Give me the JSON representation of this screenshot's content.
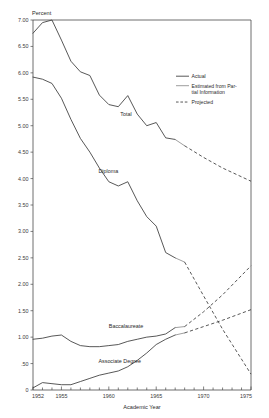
{
  "chart_data": {
    "type": "line",
    "title": "",
    "xlabel": "Academic Year",
    "ylabel": "Percent",
    "xlim": [
      1952,
      1975
    ],
    "ylim": [
      0,
      7.0
    ],
    "grid": false,
    "legend_position": "upper-right",
    "ytick_labels": [
      "7.00",
      "6.50",
      "6.00",
      "5.50",
      "5.00",
      "4.50",
      "4.00",
      "3.50",
      "3.00",
      "2.50",
      "2.00",
      "1.50",
      "1.00",
      ".50",
      "0"
    ],
    "ytick_values": [
      7.0,
      6.5,
      6.0,
      5.5,
      5.0,
      4.5,
      4.0,
      3.5,
      3.0,
      2.5,
      2.0,
      1.5,
      1.0,
      0.5,
      0.0
    ],
    "xtick_labels": [
      "1952",
      "1955",
      "1960",
      "1965",
      "1970",
      "1975"
    ],
    "xtick_values": [
      1952,
      1955,
      1960,
      1965,
      1970,
      1975
    ],
    "xtick_minor": [
      1953,
      1954,
      1956,
      1957,
      1958,
      1959,
      1961,
      1962,
      1963,
      1964,
      1966,
      1967,
      1968,
      1969,
      1971,
      1972,
      1973,
      1974
    ],
    "legend": [
      {
        "label": "Actual",
        "style": "solid",
        "color": "#3a3a3a"
      },
      {
        "label": "Estimated from Par-",
        "label2": "tial Information",
        "style": "solid-light",
        "color": "#8c8c8c"
      },
      {
        "label": "Projected",
        "style": "dashed",
        "color": "#3a3a3a"
      }
    ],
    "series": [
      {
        "name": "Total",
        "label_text": "Total",
        "actual": {
          "x": [
            1952,
            1953,
            1954,
            1955,
            1956,
            1957,
            1958,
            1959,
            1960,
            1961,
            1962,
            1963,
            1964,
            1965,
            1966,
            1967
          ],
          "y": [
            6.75,
            6.95,
            7.0,
            6.62,
            6.22,
            6.02,
            5.95,
            5.58,
            5.4,
            5.36,
            5.57,
            5.22,
            5.0,
            5.06,
            4.77,
            4.74
          ]
        },
        "estimated": {
          "x": [
            1967,
            1968
          ],
          "y": [
            4.74,
            4.62
          ]
        },
        "projected": {
          "x": [
            1968,
            1970,
            1972,
            1975
          ],
          "y": [
            4.62,
            4.4,
            4.2,
            3.95
          ]
        }
      },
      {
        "name": "Diploma",
        "label_text": "Diploma",
        "actual": {
          "x": [
            1952,
            1953,
            1954,
            1955,
            1956,
            1957,
            1958,
            1959,
            1960,
            1961,
            1962,
            1963,
            1964,
            1965,
            1966,
            1967
          ],
          "y": [
            5.92,
            5.88,
            5.8,
            5.52,
            5.12,
            4.76,
            4.5,
            4.2,
            3.94,
            3.86,
            3.94,
            3.58,
            3.28,
            3.1,
            2.6,
            2.5
          ]
        },
        "estimated": {
          "x": [
            1967,
            1968
          ],
          "y": [
            2.5,
            2.42
          ]
        },
        "projected": {
          "x": [
            1968,
            1970,
            1972,
            1975
          ],
          "y": [
            2.42,
            1.78,
            1.15,
            0.3
          ]
        }
      },
      {
        "name": "Baccalaureate",
        "label_text": "Baccalaureate",
        "actual": {
          "x": [
            1952,
            1953,
            1954,
            1955,
            1956,
            1957,
            1958,
            1959,
            1960,
            1961,
            1962,
            1963,
            1964,
            1965,
            1966,
            1967
          ],
          "y": [
            0.96,
            0.98,
            1.02,
            1.04,
            0.92,
            0.84,
            0.82,
            0.82,
            0.84,
            0.86,
            0.92,
            0.96,
            1.0,
            1.02,
            1.06,
            1.18
          ]
        },
        "estimated": {
          "x": [
            1967,
            1968
          ],
          "y": [
            1.18,
            1.2
          ]
        },
        "projected": {
          "x": [
            1968,
            1970,
            1972,
            1975
          ],
          "y": [
            1.2,
            1.48,
            1.8,
            2.35
          ]
        }
      },
      {
        "name": "Associate Degree",
        "label_text": "Associate Degree",
        "actual": {
          "x": [
            1952,
            1953,
            1954,
            1955,
            1956,
            1957,
            1958,
            1959,
            1960,
            1961,
            1962,
            1963,
            1964,
            1965,
            1966,
            1967
          ],
          "y": [
            0.04,
            0.14,
            0.12,
            0.1,
            0.1,
            0.16,
            0.22,
            0.28,
            0.32,
            0.36,
            0.44,
            0.56,
            0.7,
            0.86,
            0.96,
            1.04
          ]
        },
        "estimated": {
          "x": [
            1967,
            1968
          ],
          "y": [
            1.04,
            1.08
          ]
        },
        "projected": {
          "x": [
            1968,
            1970,
            1972,
            1975
          ],
          "y": [
            1.08,
            1.2,
            1.32,
            1.52
          ]
        }
      }
    ],
    "annotations": [
      {
        "text": "Total",
        "x": 1961.2,
        "y": 5.18
      },
      {
        "text": "Diploma",
        "x": 1958.9,
        "y": 4.1
      },
      {
        "text": "Baccalaureate",
        "x": 1960.0,
        "y": 1.18
      },
      {
        "text": "Associate Degree",
        "x": 1958.9,
        "y": 0.52
      }
    ]
  }
}
